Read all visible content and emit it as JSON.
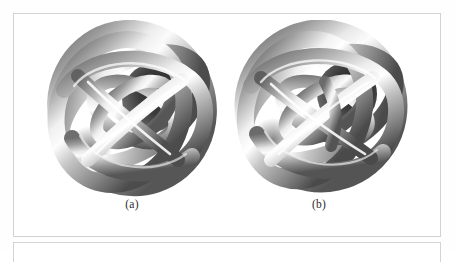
{
  "page": {
    "background_color": "#fefefe",
    "frame_border_color": "#d2d2d2"
  },
  "figure": {
    "frame_name": "figure-frame",
    "panels": [
      {
        "id": "a",
        "label": "(a)",
        "caption_position": "below",
        "graphic": "3d-tubular-knot-render",
        "description": "Grey shaded 3D tubular knot composed of interlocking circular loops forming a sphere-like cage"
      },
      {
        "id": "b",
        "label": "(b)",
        "caption_position": "below",
        "graphic": "3d-tubular-knot-render",
        "description": "Grey shaded 3D tubular knot composed of interlocking circular loops forming a sphere-like cage, rotated variant"
      }
    ]
  },
  "render_style": {
    "tube_base_color": "#a8a8a8",
    "tube_highlight_color": "#f2f2f2",
    "tube_shadow_color": "#555555",
    "tube_dark_color": "#1d1d1d",
    "background_color": "#ffffff"
  },
  "next_block": {
    "name": "following-figure-frame",
    "visible_portion": "top-edge-only"
  }
}
